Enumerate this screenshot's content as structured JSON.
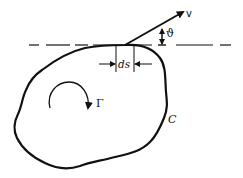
{
  "diagram": {
    "type": "circulation-contour",
    "labels": {
      "velocity": "v",
      "angle": "ϑ",
      "element": "ds",
      "circulation": "Γ",
      "contour": "C"
    },
    "colors": {
      "stroke": "#111111",
      "background": "#ffffff"
    },
    "elements": [
      {
        "id": "contour-C",
        "kind": "closed-curve",
        "label": "C"
      },
      {
        "id": "tangent-line",
        "kind": "dashed-line",
        "style": "dashed"
      },
      {
        "id": "velocity-vector",
        "kind": "arrow",
        "label": "v"
      },
      {
        "id": "angle-theta",
        "kind": "angle-marker",
        "label": "ϑ"
      },
      {
        "id": "line-element-ds",
        "kind": "dimension",
        "label": "ds"
      },
      {
        "id": "circulation-arrow",
        "kind": "curved-arrow",
        "label": "Γ",
        "direction": "clockwise"
      }
    ]
  }
}
